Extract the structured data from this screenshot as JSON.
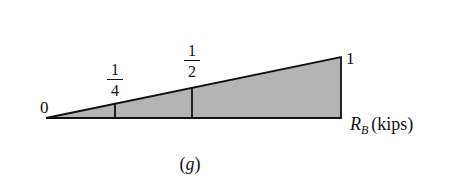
{
  "diagram": {
    "type": "influence-line",
    "quantity_label": "R",
    "quantity_subscript": "B",
    "units_label": "(kips)",
    "caption": "(g)",
    "start_value_label": "0",
    "end_value_label": "1",
    "ordinates": [
      {
        "numerator": "1",
        "denominator": "4",
        "value": 0.25
      },
      {
        "numerator": "1",
        "denominator": "2",
        "value": 0.5
      }
    ],
    "colors": {
      "fill": "#b4b4b4",
      "stroke": "#111111"
    }
  }
}
